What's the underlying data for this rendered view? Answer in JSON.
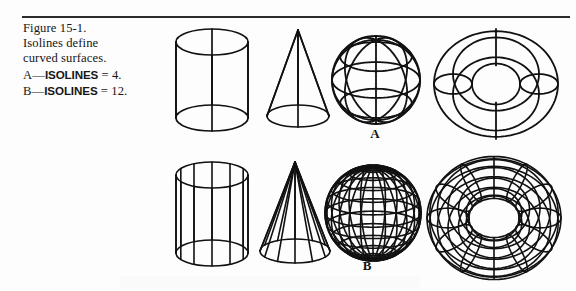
{
  "figure": {
    "caption_lines": [
      "Figure 15-1.",
      "Isolines define",
      "curved surfaces."
    ],
    "caption_line_a_prefix": "A—",
    "caption_line_a_bold": "ISOLINES",
    "caption_line_a_suffix": " = 4.",
    "caption_line_b_prefix": "B—",
    "caption_line_b_bold": "ISOLINES",
    "caption_line_b_suffix": " = 12.",
    "row_a_label": "A",
    "row_b_label": "B",
    "ink_color": "#111111",
    "rule_color": "#2b2b2b",
    "background_color": "#fdfdfd"
  },
  "chart_data": {
    "type": "diagram",
    "title": "Figure 15-1. Isolines define curved surfaces.",
    "rows": [
      {
        "label": "A",
        "isolines": 4,
        "shapes": [
          {
            "name": "cylinder",
            "isolines": 4
          },
          {
            "name": "cone",
            "isolines": 4
          },
          {
            "name": "sphere",
            "isolines": 4
          },
          {
            "name": "torus",
            "isolines": 4
          }
        ]
      },
      {
        "label": "B",
        "isolines": 12,
        "shapes": [
          {
            "name": "cylinder",
            "isolines": 12
          },
          {
            "name": "cone",
            "isolines": 12
          },
          {
            "name": "sphere",
            "isolines": 12
          },
          {
            "name": "torus",
            "isolines": 12
          }
        ]
      }
    ],
    "shape_order": [
      "cylinder",
      "cone",
      "sphere",
      "torus"
    ],
    "xlabel": "",
    "ylabel": ""
  }
}
